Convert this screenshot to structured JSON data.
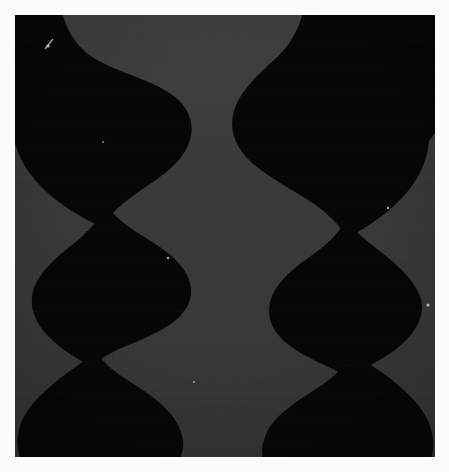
{
  "image": {
    "title": "Dark abstract silhouette plate",
    "description": "Two vertical columns of stacked black organic blob shapes on a textured dark gray field, surrounded by a light paper border.",
    "width": 449,
    "height": 472,
    "subject_count": 2,
    "has_text": false,
    "has_ui_chrome": false
  },
  "frame": {
    "border_color": "#fbfbfb",
    "inset_left": 15,
    "inset_top": 15,
    "content_width": 420,
    "content_height": 442
  },
  "palette": {
    "paper_border": "#fbfbfb",
    "background_field": "#3a3a3a",
    "background_field_light": "#414141",
    "background_field_dark": "#333333",
    "silhouette": "#060606",
    "silhouette_edge": "#0c0c0c",
    "highlight_speck": "#e8e8e8"
  },
  "columns": [
    {
      "name": "left-column",
      "center_x": 120,
      "lobes": [
        {
          "name": "upper-lobe",
          "center_y": 108,
          "max_half_width": 112,
          "top_y": 15,
          "bottom_y": 205
        },
        {
          "name": "middle-lobe",
          "center_y": 272,
          "max_half_width": 100,
          "top_y": 205,
          "bottom_y": 340
        },
        {
          "name": "lower-lobe",
          "center_y": 400,
          "max_half_width": 102,
          "top_y": 340,
          "bottom_y": 457
        }
      ],
      "waist_y_values": [
        205,
        340
      ],
      "waist_half_width": 42
    },
    {
      "name": "right-column",
      "center_x": 355,
      "lobes": [
        {
          "name": "upper-lobe",
          "center_y": 108,
          "max_half_width": 112,
          "top_y": 15,
          "bottom_y": 205
        },
        {
          "name": "middle-lobe",
          "center_y": 272,
          "max_half_width": 100,
          "top_y": 205,
          "bottom_y": 340
        },
        {
          "name": "lower-lobe",
          "center_y": 400,
          "max_half_width": 102,
          "top_y": 340,
          "bottom_y": 457
        }
      ],
      "waist_y_values": [
        205,
        340
      ],
      "waist_half_width": 42
    }
  ],
  "specks": [
    {
      "name": "speck-upper-left",
      "x": 48,
      "y": 46,
      "size": 3
    },
    {
      "name": "speck-mid-left",
      "x": 103,
      "y": 142,
      "size": 2
    },
    {
      "name": "speck-waist-left",
      "x": 168,
      "y": 258,
      "size": 2
    },
    {
      "name": "speck-lower-left",
      "x": 194,
      "y": 382,
      "size": 2
    },
    {
      "name": "speck-upper-right",
      "x": 388,
      "y": 208,
      "size": 2
    },
    {
      "name": "speck-mid-right",
      "x": 428,
      "y": 305,
      "size": 3
    }
  ]
}
